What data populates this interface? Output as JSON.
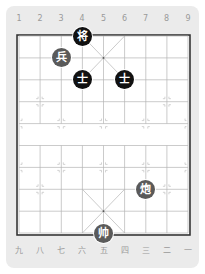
{
  "board": {
    "files_top": [
      "1",
      "2",
      "3",
      "4",
      "5",
      "6",
      "7",
      "8",
      "9"
    ],
    "files_bottom": [
      "九",
      "八",
      "七",
      "六",
      "五",
      "四",
      "三",
      "二",
      "一"
    ],
    "colors": {
      "card": "#ebebeb",
      "board": "#ffffff",
      "grid_line": "#b5b5b5",
      "border": "#333333",
      "marker": "#c8c8c8",
      "black_piece": "#111111",
      "red_piece": "#5a5a5a"
    }
  },
  "pieces": [
    {
      "char": "将",
      "side": "black",
      "type": "general",
      "file": 4,
      "rank": 0
    },
    {
      "char": "兵",
      "side": "red",
      "type": "soldier",
      "file": 3,
      "rank": 1
    },
    {
      "char": "士",
      "side": "black",
      "type": "advisor",
      "file": 4,
      "rank": 2
    },
    {
      "char": "士",
      "side": "black",
      "type": "advisor",
      "file": 6,
      "rank": 2
    },
    {
      "char": "炮",
      "side": "red",
      "type": "cannon",
      "file": 7,
      "rank": 7
    },
    {
      "char": "帅",
      "side": "red",
      "type": "general",
      "file": 5,
      "rank": 9
    }
  ]
}
